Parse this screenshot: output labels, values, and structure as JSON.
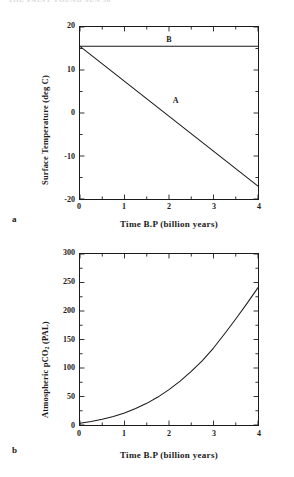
{
  "page": {
    "running_head": "THE FAINT YOUNG SUN  50"
  },
  "figure": {
    "panels": [
      {
        "letter": "a",
        "chart_key": "0"
      },
      {
        "letter": "b",
        "chart_key": "1"
      }
    ]
  },
  "chart_data": [
    {
      "type": "line",
      "panel": "a",
      "title": "",
      "xlabel": "Time B.P (billion years)",
      "ylabel": "Surface Temperature (deg C)",
      "xlim": [
        0,
        4
      ],
      "ylim": [
        -20,
        20
      ],
      "xticks": [
        0,
        1,
        2,
        3,
        4
      ],
      "xticklabels": [
        "0",
        "1",
        "2",
        "3",
        "4"
      ],
      "yticks": [
        -20,
        -10,
        0,
        10,
        20
      ],
      "yticklabels": [
        "-20",
        "-10",
        "0",
        "10",
        "20"
      ],
      "yminorticks": [
        -15,
        -5,
        5,
        15
      ],
      "grid": false,
      "legend": "in-plot labels",
      "series": [
        {
          "name": "B",
          "label": "B",
          "label_x": 2.0,
          "label_y": 17.3,
          "x": [
            0,
            4
          ],
          "values": [
            15.5,
            15.5
          ]
        },
        {
          "name": "A",
          "label": "A",
          "label_x": 2.15,
          "label_y": 3.0,
          "x": [
            0,
            4
          ],
          "values": [
            15.5,
            -17.0
          ]
        }
      ]
    },
    {
      "type": "line",
      "panel": "b",
      "title": "",
      "xlabel": "Time B.P (billion years)",
      "ylabel": "Atmospheric pCO2 (PAL)",
      "ylabel_html": "Atmospheric  pCO<sub>2</sub>  (PAL)",
      "xlim": [
        0,
        4
      ],
      "ylim": [
        0,
        300
      ],
      "xticks": [
        0,
        1,
        2,
        3,
        4
      ],
      "xticklabels": [
        "0",
        "1",
        "2",
        "3",
        "4"
      ],
      "yticks": [
        0,
        50,
        100,
        150,
        200,
        250,
        300
      ],
      "yticklabels": [
        "0",
        "50",
        "100",
        "150",
        "200",
        "250",
        "300"
      ],
      "yminorticks": [
        25,
        75,
        125,
        175,
        225,
        275
      ],
      "grid": false,
      "series": [
        {
          "name": "pCO2",
          "x": [
            0,
            0.25,
            0.5,
            0.75,
            1.0,
            1.25,
            1.5,
            1.75,
            2.0,
            2.25,
            2.5,
            2.75,
            3.0,
            3.25,
            3.5,
            3.75,
            4.0
          ],
          "values": [
            3,
            6,
            10,
            15,
            21,
            29,
            38,
            49,
            62,
            77,
            94,
            113,
            135,
            160,
            186,
            213,
            241
          ]
        }
      ]
    }
  ],
  "colors": {
    "ink": "#1a1a1a",
    "paper": "#ffffff",
    "faint": "#d8d8dc"
  }
}
